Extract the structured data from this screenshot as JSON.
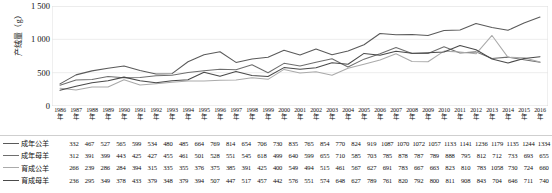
{
  "axis": {
    "ylabel": "产绒量（g）",
    "yticks": [
      "1 500",
      "1 000",
      "500",
      "0"
    ],
    "ylim": [
      0,
      1500
    ],
    "year_suffix": "年"
  },
  "chart_data": {
    "type": "line",
    "title": "",
    "xlabel": "",
    "ylabel": "产绒量（g）",
    "ylim": [
      0,
      1500
    ],
    "yticks": [
      0,
      500,
      1000,
      1500
    ],
    "grid": true,
    "legend_position": "table-below",
    "categories": [
      "1986",
      "1987",
      "1988",
      "1989",
      "1990",
      "1991",
      "1992",
      "1993",
      "1994",
      "1995",
      "1996",
      "1997",
      "1998",
      "1999",
      "2000",
      "2001",
      "2002",
      "2003",
      "2004",
      "2005",
      "2006",
      "2007",
      "2008",
      "2009",
      "2010",
      "2011",
      "2012",
      "2013",
      "2014",
      "2015",
      "2016"
    ],
    "series": [
      {
        "name": "成年公羊",
        "color": "#5a5a5a",
        "values": [
          332,
          467,
          527,
          565,
          599,
          534,
          480,
          485,
          664,
          769,
          814,
          654,
          706,
          730,
          835,
          765,
          854,
          770,
          824,
          919,
          1087,
          1070,
          1072,
          1057,
          1133,
          1141,
          1236,
          1179,
          1135,
          1244,
          1334
        ]
      },
      {
        "name": "成年母羊",
        "color": "#6e6e6e",
        "values": [
          312,
          391,
          399,
          443,
          425,
          427,
          455,
          461,
          501,
          528,
          551,
          545,
          618,
          499,
          640,
          599,
          655,
          710,
          585,
          703,
          785,
          878,
          787,
          789,
          888,
          795,
          812,
          712,
          733,
          693,
          655
        ]
      },
      {
        "name": "育成公羊",
        "color": "#aaaaaa",
        "values": [
          266,
          239,
          286,
          284,
          394,
          315,
          335,
          355,
          376,
          375,
          385,
          391,
          425,
          400,
          549,
          494,
          515,
          461,
          567,
          627,
          691,
          783,
          667,
          663,
          823,
          810,
          783,
          1058,
          730,
          724,
          660
        ]
      },
      {
        "name": "育成母羊",
        "color": "#4a4a4a",
        "values": [
          236,
          295,
          349,
          378,
          433,
          379,
          348,
          379,
          394,
          507,
          447,
          517,
          457,
          442,
          576,
          551,
          574,
          648,
          627,
          789,
          761,
          820,
          792,
          800,
          811,
          908,
          843,
          704,
          646,
          711,
          740
        ]
      }
    ]
  }
}
